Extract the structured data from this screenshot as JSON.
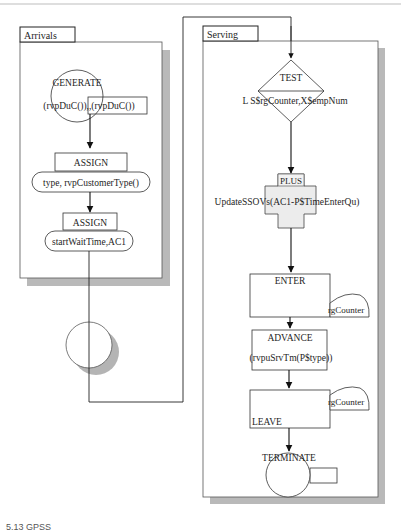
{
  "diagram": {
    "arrivals": {
      "title": "Arrivals",
      "generate": {
        "label": "GENERATE",
        "operand": "(rvpDuC()),,(rvpDuC())"
      },
      "assign1": {
        "label": "ASSIGN",
        "operand": "type, rvpCustomerType()"
      },
      "assign2": {
        "label": "ASSIGN",
        "operand": "startWaitTime,AC1"
      }
    },
    "serving": {
      "title": "Serving",
      "test": {
        "label": "TEST",
        "operand": "L S$rgCounter,X$empNum"
      },
      "plus": {
        "label": "PLUS",
        "operand": "UpdateSSOVs(AC1-P$TimeEnterQu)"
      },
      "enter": {
        "label": "ENTER",
        "operand": "rgCounter"
      },
      "advance": {
        "label": "ADVANCE",
        "operand": "(rvpuSrvTm(P$type))"
      },
      "leave": {
        "label": "LEAVE",
        "operand": "rgCounter"
      },
      "terminate": {
        "label": "TERMINATE"
      }
    },
    "colors": {
      "line": "#2a2a2a",
      "shadow": "#b4b4b4",
      "panel_fill": "#ffffff"
    }
  },
  "caption": "5.13  GPSS"
}
